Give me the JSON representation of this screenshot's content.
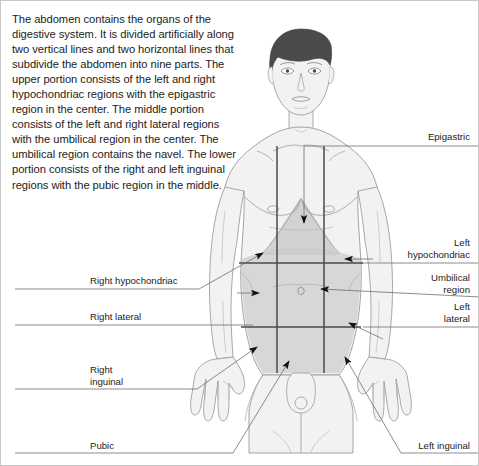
{
  "description": "The abdomen contains the organs of the digestive system. It is divided artificially along two vertical lines and two horizontal lines that subdivide the abdomen into nine parts. The upper portion consists of the left and right hypochondriac regions with the epigastric region in the center. The middle portion consists of the left and right lateral regions with the umbilical region in the center. The umbilical region contains the navel. The lower portion consists of the right and left inguinal regions with the pubic region in the middle.",
  "labels": {
    "epigastric": "Epigastric",
    "left_hypochondriac": "Left\nhypochondriac",
    "umbilical_region": "Umbilical\nregion",
    "left_lateral": "Left\nlateral",
    "left_inguinal": "Left inguinal",
    "right_hypochondriac": "Right hypochondriac",
    "right_lateral": "Right lateral",
    "right_inguinal": "Right\ninguinal",
    "pubic": "Pubic"
  },
  "colors": {
    "text": "#1c1c1c",
    "leader_line": "#8a8a8a",
    "grid_line": "#4a4a4a",
    "arrow": "#111111",
    "skin_fill": "#f2f2f2",
    "skin_stroke": "#9a9a9a",
    "abdomen_shade": "#d2d2d2",
    "epigastric_shade": "#c9c9c9",
    "hair": "#4a4a4a",
    "background": "#ffffff",
    "frame": "#c8c8c8"
  },
  "figure": {
    "grid": {
      "vertical_x": [
        276,
        323
      ],
      "horizontal_y": [
        262,
        326
      ],
      "vertical_top": 145,
      "vertical_bottom": 372
    }
  }
}
